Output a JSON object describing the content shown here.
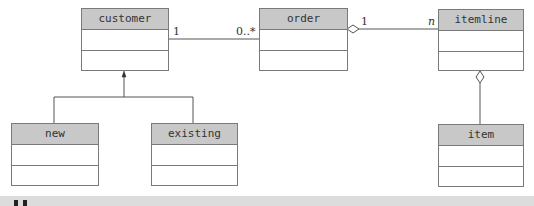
{
  "diagram": {
    "type": "UML class diagram",
    "classes": [
      {
        "id": "customer",
        "name": "customer"
      },
      {
        "id": "order",
        "name": "order"
      },
      {
        "id": "itemline",
        "name": "itemline"
      },
      {
        "id": "new",
        "name": "new"
      },
      {
        "id": "existing",
        "name": "existing"
      },
      {
        "id": "item",
        "name": "item"
      }
    ],
    "relationships": [
      {
        "type": "association",
        "from": "customer",
        "to": "order",
        "from_multiplicity": "1",
        "to_multiplicity": "0..*"
      },
      {
        "type": "aggregation",
        "whole": "order",
        "part": "itemline",
        "whole_multiplicity": "1",
        "part_multiplicity": "n"
      },
      {
        "type": "aggregation",
        "whole": "itemline",
        "part": "item"
      },
      {
        "type": "generalization",
        "parent": "customer",
        "children": [
          "new",
          "existing"
        ]
      }
    ],
    "labels": {
      "customer_order_left": "1",
      "customer_order_right": "0..*",
      "order_itemline_left": "1",
      "order_itemline_right": "n"
    }
  },
  "colors": {
    "header_fill": "#c8c8c8",
    "border": "#7a7a7a",
    "line": "#555555",
    "bottom_bar": "#dcdcdc"
  }
}
